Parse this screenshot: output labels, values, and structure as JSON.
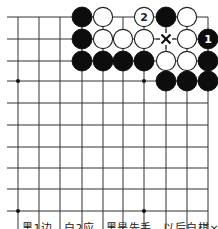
{
  "diagram": {
    "type": "go-board-fragment",
    "grid": {
      "columns_x": [
        18,
        39,
        60,
        82,
        103,
        123,
        144,
        166,
        187,
        208
      ],
      "rows_y": [
        17,
        39,
        61,
        81,
        103,
        125,
        147,
        168,
        189,
        211
      ],
      "top_edge": true,
      "right_edge": true,
      "left_extends_to": 7,
      "bottom_extends_to": 229,
      "line_color": "#333333",
      "star_points": [
        [
          0,
          3
        ],
        [
          6,
          3
        ],
        [
          0,
          9
        ],
        [
          6,
          9
        ]
      ]
    },
    "stones": [
      {
        "col": 3,
        "row": 0,
        "color": "black",
        "label": ""
      },
      {
        "col": 4,
        "row": 0,
        "color": "white",
        "label": ""
      },
      {
        "col": 6,
        "row": 0,
        "color": "white",
        "label": "2"
      },
      {
        "col": 7,
        "row": 0,
        "color": "black",
        "label": ""
      },
      {
        "col": 8,
        "row": 0,
        "color": "white",
        "label": ""
      },
      {
        "col": 3,
        "row": 1,
        "color": "black",
        "label": ""
      },
      {
        "col": 4,
        "row": 1,
        "color": "white",
        "label": ""
      },
      {
        "col": 5,
        "row": 1,
        "color": "white",
        "label": ""
      },
      {
        "col": 6,
        "row": 1,
        "color": "white",
        "label": ""
      },
      {
        "col": 8,
        "row": 1,
        "color": "white",
        "label": ""
      },
      {
        "col": 9,
        "row": 1,
        "color": "black",
        "label": "1"
      },
      {
        "col": 3,
        "row": 2,
        "color": "black",
        "label": ""
      },
      {
        "col": 4,
        "row": 2,
        "color": "black",
        "label": ""
      },
      {
        "col": 5,
        "row": 2,
        "color": "black",
        "label": ""
      },
      {
        "col": 6,
        "row": 2,
        "color": "black",
        "label": ""
      },
      {
        "col": 7,
        "row": 2,
        "color": "white",
        "label": ""
      },
      {
        "col": 8,
        "row": 2,
        "color": "white",
        "label": ""
      },
      {
        "col": 9,
        "row": 2,
        "color": "black",
        "label": ""
      },
      {
        "col": 7,
        "row": 3,
        "color": "black",
        "label": ""
      },
      {
        "col": 8,
        "row": 3,
        "color": "black",
        "label": ""
      },
      {
        "col": 9,
        "row": 3,
        "color": "black",
        "label": ""
      }
    ],
    "marks": [
      {
        "col": 7,
        "row": 1,
        "symbol": "×"
      }
    ],
    "caption": "黑1边，白2应，黑是先手，以后白棋×位"
  }
}
